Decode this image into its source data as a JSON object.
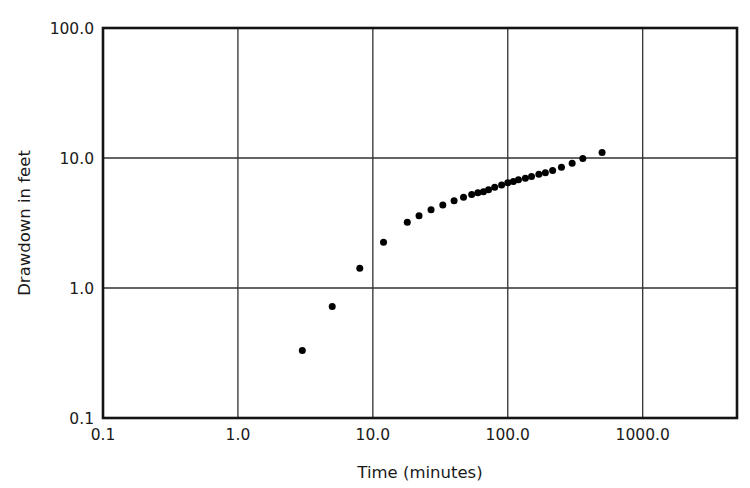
{
  "chart_data": {
    "type": "scatter",
    "title": "",
    "xlabel": "Time (minutes)",
    "ylabel": "Drawdown in feet",
    "xscale": "log",
    "yscale": "log",
    "xlim": [
      0.1,
      5000.0
    ],
    "ylim": [
      0.1,
      100.0
    ],
    "grid": true,
    "legend": null,
    "xticks": [
      0.1,
      1.0,
      10.0,
      100.0,
      1000.0
    ],
    "xtick_labels": [
      "0.1",
      "1.0",
      "10.0",
      "100.0",
      "1000.0"
    ],
    "yticks": [
      0.1,
      1.0,
      10.0,
      100.0
    ],
    "ytick_labels": [
      "0.1",
      "1.0",
      "10.0",
      "100.0"
    ],
    "marker": "filled-circle",
    "marker_color": "#000000",
    "marker_size": 7,
    "series": [
      {
        "name": "Drawdown",
        "x": [
          3.0,
          5.0,
          8.0,
          12.0,
          18.0,
          22.0,
          27.0,
          33.0,
          40.0,
          47.0,
          54.0,
          60.0,
          66.0,
          72.0,
          80.0,
          90.0,
          100.0,
          110.0,
          120.0,
          135.0,
          150.0,
          170.0,
          190.0,
          215.0,
          250.0,
          300.0,
          360.0,
          500.0
        ],
        "y": [
          0.33,
          0.72,
          1.42,
          2.25,
          3.2,
          3.6,
          4.0,
          4.35,
          4.7,
          5.0,
          5.25,
          5.4,
          5.5,
          5.7,
          5.95,
          6.2,
          6.45,
          6.6,
          6.8,
          7.0,
          7.2,
          7.5,
          7.7,
          8.0,
          8.5,
          9.1,
          9.9,
          11.0
        ]
      }
    ]
  },
  "axes": {
    "y_title": "Drawdown in feet",
    "x_title": "Time (minutes)"
  },
  "colors": {
    "frame": "#141414",
    "grid": "#303030",
    "marker": "#000000",
    "background": "#ffffff"
  }
}
